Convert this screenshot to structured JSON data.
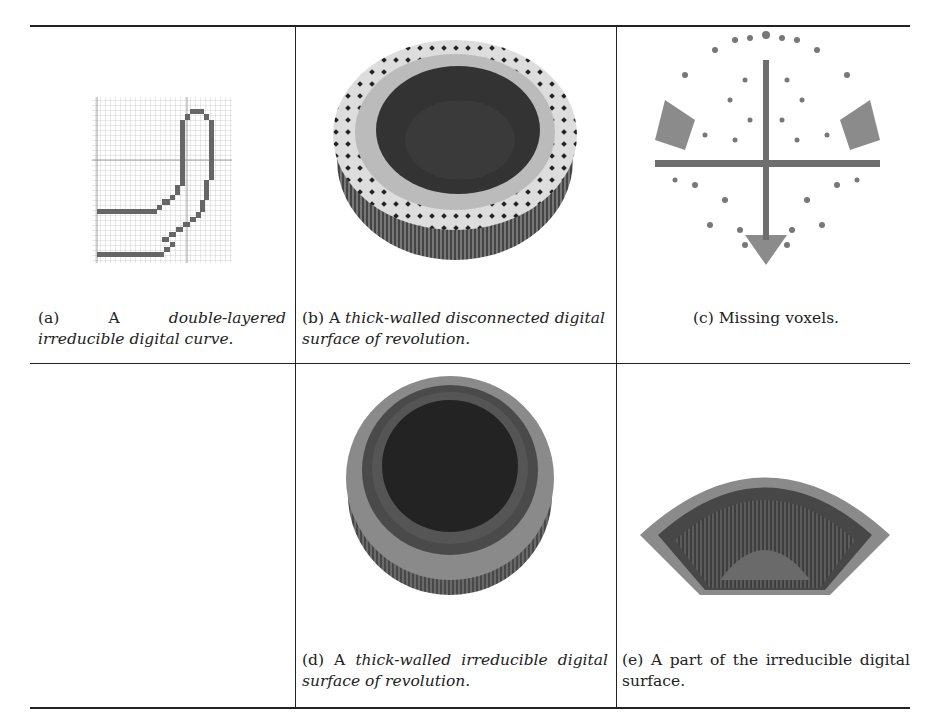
{
  "figure": {
    "panels": [
      {
        "id": "a",
        "label": "(a)",
        "prefix": "A",
        "italic": "double-layered irreducible digital curve.",
        "suffix": "",
        "image": "pixel-grid-digital-curve"
      },
      {
        "id": "b",
        "label": "(b)",
        "prefix": "A",
        "italic": "thick-walled disconnected digital surface of revolution.",
        "suffix": "",
        "image": "voxel-bowl-disconnected"
      },
      {
        "id": "c",
        "label": "(c)",
        "prefix": "Missing voxels.",
        "italic": "",
        "suffix": "",
        "image": "missing-voxels-scatter"
      },
      {
        "id": "d",
        "label": "(d)",
        "prefix": "A",
        "italic": "thick-walled irreducible digital surface of revolution.",
        "suffix": "",
        "image": "voxel-bowl-irreducible"
      },
      {
        "id": "e",
        "label": "(e)",
        "prefix": "A part of the irreducible digital surface.",
        "italic": "",
        "suffix": "",
        "image": "voxel-bowl-part"
      }
    ]
  }
}
